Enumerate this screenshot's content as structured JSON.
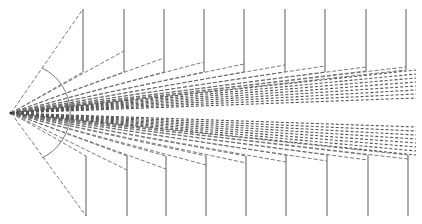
{
  "diagram": {
    "type": "ray-fan-projection",
    "colors": {
      "line": "#5a5a5a",
      "dash": "#6a6a6a",
      "background": "#ffffff"
    },
    "apex": {
      "x": 11,
      "y": 113
    },
    "arc": {
      "radius": 50,
      "start": {
        "x": 42,
        "y": 68
      },
      "mid": {
        "x": 61,
        "y": 113
      },
      "end": {
        "x": 42,
        "y": 158
      }
    },
    "top_verticals": [
      {
        "x": 83,
        "y_top": 9,
        "y_bottom": 72,
        "ray_y": 9
      },
      {
        "x": 124,
        "y_top": 9,
        "y_bottom": 72,
        "ray_y": 51
      },
      {
        "x": 164,
        "y_top": 9,
        "y_bottom": 72,
        "ray_y": 58
      },
      {
        "x": 204,
        "y_top": 9,
        "y_bottom": 72,
        "ray_y": 62
      },
      {
        "x": 244,
        "y_top": 9,
        "y_bottom": 72,
        "ray_y": 64
      },
      {
        "x": 285,
        "y_top": 9,
        "y_bottom": 72,
        "ray_y": 65
      },
      {
        "x": 325,
        "y_top": 9,
        "y_bottom": 72,
        "ray_y": 66
      },
      {
        "x": 366,
        "y_top": 9,
        "y_bottom": 71,
        "ray_y": 67
      },
      {
        "x": 406,
        "y_top": 9,
        "y_bottom": 70,
        "ray_y": 67
      }
    ],
    "bottom_verticals": [
      {
        "x": 86,
        "y_top": 156,
        "y_bottom": 216,
        "ray_y": 216
      },
      {
        "x": 127,
        "y_top": 156,
        "y_bottom": 216,
        "ray_y": 170
      },
      {
        "x": 166,
        "y_top": 156,
        "y_bottom": 216,
        "ray_y": 169
      },
      {
        "x": 206,
        "y_top": 156,
        "y_bottom": 216,
        "ray_y": 165
      },
      {
        "x": 246,
        "y_top": 156,
        "y_bottom": 216,
        "ray_y": 163
      },
      {
        "x": 286,
        "y_top": 155,
        "y_bottom": 216,
        "ray_y": 162
      },
      {
        "x": 327,
        "y_top": 155,
        "y_bottom": 216,
        "ray_y": 161
      },
      {
        "x": 368,
        "y_top": 155,
        "y_bottom": 216,
        "ray_y": 160
      },
      {
        "x": 408,
        "y_top": 155,
        "y_bottom": 216,
        "ray_y": 159
      }
    ],
    "top_fan_ends": [
      {
        "x": 416,
        "y": 70
      },
      {
        "x": 416,
        "y": 74
      },
      {
        "x": 416,
        "y": 78
      },
      {
        "x": 416,
        "y": 82
      },
      {
        "x": 416,
        "y": 86
      },
      {
        "x": 416,
        "y": 90
      },
      {
        "x": 416,
        "y": 94
      },
      {
        "x": 416,
        "y": 98
      }
    ],
    "bottom_fan_ends": [
      {
        "x": 416,
        "y": 155
      },
      {
        "x": 416,
        "y": 151
      },
      {
        "x": 416,
        "y": 147
      },
      {
        "x": 416,
        "y": 143
      },
      {
        "x": 416,
        "y": 139
      },
      {
        "x": 416,
        "y": 135
      },
      {
        "x": 416,
        "y": 131
      },
      {
        "x": 416,
        "y": 127
      }
    ]
  }
}
